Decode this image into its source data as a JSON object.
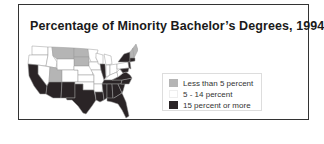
{
  "title": "Percentage of Minority Bachelor’s Degrees, 1994",
  "legend": {
    "items": [
      {
        "label": "Less than 5 percent",
        "color": "#b5b5b5"
      },
      {
        "label": "5 - 14 percent",
        "color": "#ffffff"
      },
      {
        "label": "15 percent or more",
        "color": "#2a2426"
      }
    ]
  },
  "map": {
    "region": "United States",
    "categories": {
      "less_than_5": [
        "Montana",
        "North Dakota",
        "South Dakota",
        "Utah",
        "Maine",
        "Vermont",
        "New Hampshire"
      ],
      "5_to_14": [
        "Washington",
        "Oregon",
        "Idaho",
        "Wyoming",
        "Colorado",
        "Nebraska",
        "Kansas",
        "Minnesota",
        "Iowa",
        "Missouri",
        "Wisconsin",
        "Michigan",
        "Indiana",
        "Ohio",
        "Kentucky",
        "Pennsylvania",
        "West Virginia",
        "Arkansas",
        "Nevada",
        "Oklahoma"
      ],
      "15_or_more": [
        "California",
        "Arizona",
        "New Mexico",
        "Texas",
        "Louisiana",
        "Mississippi",
        "Alabama",
        "Georgia",
        "Florida",
        "South Carolina",
        "North Carolina",
        "Tennessee",
        "Virginia",
        "Maryland",
        "Illinois",
        "New York",
        "New Jersey"
      ]
    }
  }
}
